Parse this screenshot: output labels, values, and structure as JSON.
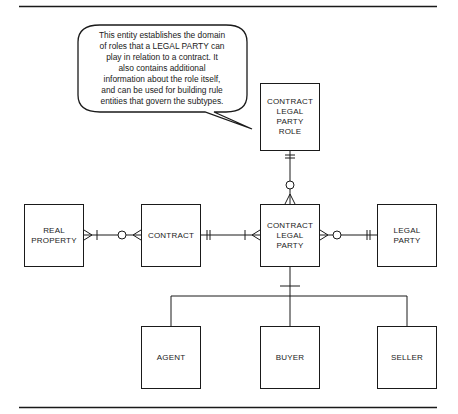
{
  "diagram": {
    "type": "entity-relationship",
    "notation": "crow's foot",
    "callout": {
      "text_lines": [
        "This entity establishes the domain",
        "of roles that a LEGAL PARTY can",
        "play in relation to a contract.  It",
        "also contains additional",
        "information about the role itself,",
        "and can be used for building rule",
        "entities that govern the subtypes."
      ],
      "points_to": "CONTRACT LEGAL PARTY ROLE"
    },
    "entities": {
      "contract_legal_party_role": [
        "CONTRACT",
        "LEGAL",
        "PARTY",
        "ROLE"
      ],
      "real_property": [
        "REAL",
        "PROPERTY"
      ],
      "contract": [
        "CONTRACT"
      ],
      "contract_legal_party": [
        "CONTRACT",
        "LEGAL",
        "PARTY"
      ],
      "legal_party": [
        "LEGAL",
        "PARTY"
      ],
      "agent": [
        "AGENT"
      ],
      "buyer": [
        "BUYER"
      ],
      "seller": [
        "SELLER"
      ]
    },
    "relationships": [
      {
        "from": "CONTRACT LEGAL PARTY ROLE",
        "to": "CONTRACT LEGAL PARTY",
        "from_end": "exactly one",
        "to_end": "zero or many"
      },
      {
        "from": "REAL PROPERTY",
        "to": "CONTRACT",
        "from_end": "one or many",
        "to_end": "zero or many"
      },
      {
        "from": "CONTRACT",
        "to": "CONTRACT LEGAL PARTY",
        "from_end": "exactly one",
        "to_end": "one or many"
      },
      {
        "from": "CONTRACT LEGAL PARTY",
        "to": "LEGAL PARTY",
        "from_end": "zero or many",
        "to_end": "exactly one"
      }
    ],
    "subtypes": {
      "supertype": "CONTRACT LEGAL PARTY",
      "items": [
        "AGENT",
        "BUYER",
        "SELLER"
      ]
    },
    "colors": {
      "line": "#1a1a1a",
      "background": "#ffffff"
    }
  }
}
